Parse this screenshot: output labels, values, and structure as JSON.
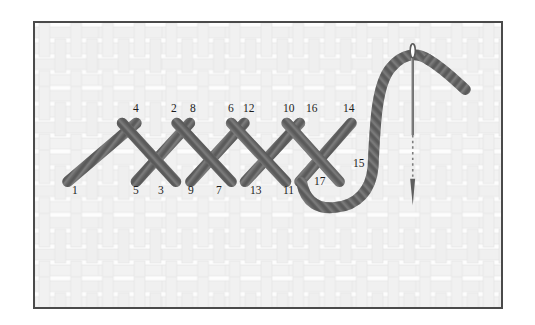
{
  "figure": {
    "kind": "embroidery-stitch-diagram",
    "stitch_name": "herringbone-stitch",
    "border_color": "#4a4a4a",
    "fabric_color": "#fcfcfc",
    "fabric_weave_color": "#e8e8e8",
    "thread_color": "#6e6e6e",
    "thread_shade_color": "#4f4f4f",
    "thread_highlight_color": "#9d9d9d",
    "needle_color": "#5a5a5a",
    "label_color": "#1d1d1d"
  },
  "labels": {
    "top_row": [
      {
        "text": "4",
        "x": 133,
        "y": 108
      },
      {
        "text": "2",
        "x": 171,
        "y": 108
      },
      {
        "text": "8",
        "x": 190,
        "y": 108
      },
      {
        "text": "6",
        "x": 228,
        "y": 108
      },
      {
        "text": "12",
        "x": 246,
        "y": 108
      },
      {
        "text": "10",
        "x": 286,
        "y": 108
      },
      {
        "text": "16",
        "x": 309,
        "y": 108
      },
      {
        "text": "14",
        "x": 345,
        "y": 108
      }
    ],
    "bottom_row": [
      {
        "text": "1",
        "x": 72,
        "y": 190
      },
      {
        "text": "5",
        "x": 133,
        "y": 190
      },
      {
        "text": "3",
        "x": 158,
        "y": 190
      },
      {
        "text": "9",
        "x": 188,
        "y": 190
      },
      {
        "text": "7",
        "x": 216,
        "y": 190
      },
      {
        "text": "13",
        "x": 253,
        "y": 190
      },
      {
        "text": "11",
        "x": 285,
        "y": 190
      },
      {
        "text": "17",
        "x": 317,
        "y": 181
      }
    ],
    "side": [
      {
        "text": "15",
        "x": 356,
        "y": 163
      }
    ]
  },
  "thread_path": {
    "description": "crossed herringbone lattice running left to right, then a looping working thread that rises to the threaded needle",
    "start_point": "1",
    "end_point": "17",
    "segment_count": 17
  },
  "needle": {
    "orientation": "vertical",
    "eye_position": "top",
    "hidden_section": "dotted",
    "state": "passing-through-fabric"
  }
}
